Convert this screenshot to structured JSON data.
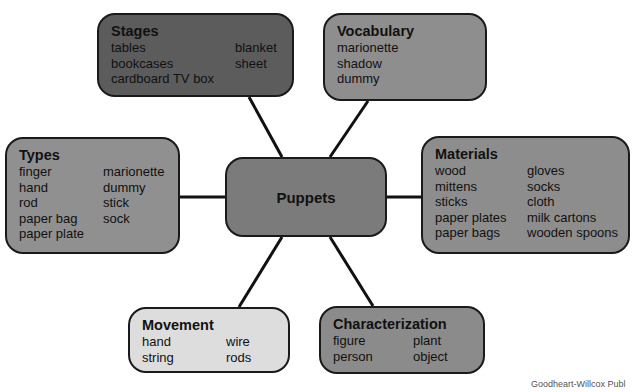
{
  "diagram": {
    "center": {
      "label": "Puppets",
      "color": "#7b7b7b"
    },
    "nodes": {
      "stages": {
        "title": "Stages",
        "color": "#5c5c5c",
        "col1": [
          "tables",
          "bookcases",
          "cardboard TV box"
        ],
        "col2": [
          "blanket",
          "sheet"
        ]
      },
      "vocabulary": {
        "title": "Vocabulary",
        "color": "#8e8e8e",
        "col1": [
          "marionette",
          "shadow",
          "dummy"
        ]
      },
      "types": {
        "title": "Types",
        "color": "#909090",
        "col1": [
          "finger",
          "hand",
          "rod",
          "paper bag",
          "paper plate"
        ],
        "col2": [
          "marionette",
          "dummy",
          "stick",
          "sock"
        ]
      },
      "materials": {
        "title": "Materials",
        "color": "#8d8d8d",
        "col1": [
          "wood",
          "mittens",
          "sticks",
          "paper plates",
          "paper bags"
        ],
        "col2": [
          "gloves",
          "socks",
          "cloth",
          "milk cartons",
          "wooden spoons"
        ]
      },
      "movement": {
        "title": "Movement",
        "color": "#dddddd",
        "col1": [
          "hand",
          "string"
        ],
        "col2": [
          "wire",
          "rods"
        ]
      },
      "characterization": {
        "title": "Characterization",
        "color": "#8b8b8b",
        "col1": [
          "figure",
          "person"
        ],
        "col2": [
          "plant",
          "object"
        ]
      }
    },
    "connector_color": "#111111"
  },
  "credit": "Goodheart-Willcox Publ"
}
